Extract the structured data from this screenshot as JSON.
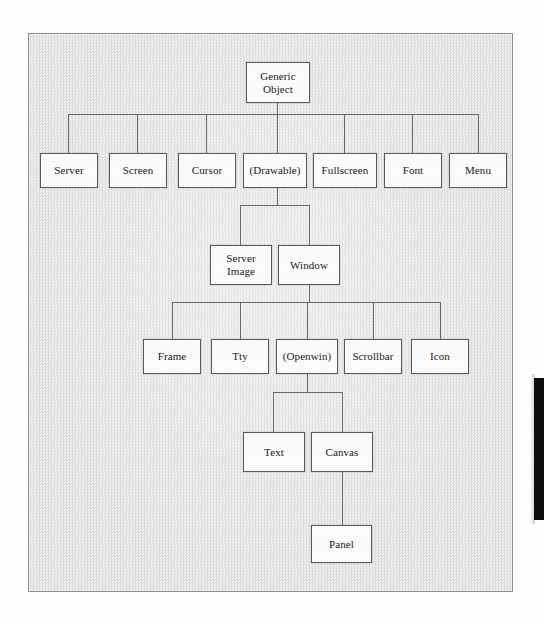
{
  "figure": {
    "kind": "class-hierarchy-diagram",
    "frame": {
      "x": 28,
      "y": 33,
      "width": 485,
      "height": 559,
      "border_color": "#8d8d8d",
      "fill_color": "#e8e8e8"
    },
    "node_style": {
      "border_color": "#5a5a5a",
      "fill_color": "#fbfbfb",
      "text_color": "#1a1a1a"
    },
    "edge_color": "#6a6a6a",
    "artifact": {
      "name": "page-edge-black-bar",
      "color": "#0b0b0b",
      "x": 534,
      "y": 378,
      "width": 10,
      "height": 142
    }
  },
  "nodes": [
    {
      "id": "generic-object",
      "label": "Generic\nObject",
      "line1": "Generic",
      "line2": "Object",
      "x": 246,
      "y": 62,
      "w": 64,
      "h": 41,
      "level": 0
    },
    {
      "id": "server",
      "label": "Server",
      "x": 40,
      "y": 153,
      "w": 58,
      "h": 35,
      "level": 1
    },
    {
      "id": "screen",
      "label": "Screen",
      "x": 109,
      "y": 153,
      "w": 58,
      "h": 35,
      "level": 1
    },
    {
      "id": "cursor",
      "label": "Cursor",
      "x": 178,
      "y": 153,
      "w": 58,
      "h": 35,
      "level": 1
    },
    {
      "id": "drawable",
      "label": "(Drawable)",
      "x": 243,
      "y": 153,
      "w": 64,
      "h": 35,
      "level": 1
    },
    {
      "id": "fullscreen",
      "label": "Fullscreen",
      "x": 313,
      "y": 153,
      "w": 64,
      "h": 35,
      "level": 1
    },
    {
      "id": "font",
      "label": "Font",
      "x": 384,
      "y": 153,
      "w": 58,
      "h": 35,
      "level": 1
    },
    {
      "id": "menu",
      "label": "Menu",
      "x": 449,
      "y": 153,
      "w": 58,
      "h": 35,
      "level": 1
    },
    {
      "id": "server-image",
      "label": "Server\nImage",
      "line1": "Server",
      "line2": "Image",
      "x": 210,
      "y": 245,
      "w": 62,
      "h": 40,
      "level": 2
    },
    {
      "id": "window",
      "label": "Window",
      "x": 278,
      "y": 245,
      "w": 62,
      "h": 40,
      "level": 2
    },
    {
      "id": "frame",
      "label": "Frame",
      "x": 143,
      "y": 339,
      "w": 58,
      "h": 35,
      "level": 3
    },
    {
      "id": "tty",
      "label": "Tty",
      "x": 211,
      "y": 339,
      "w": 58,
      "h": 35,
      "level": 3
    },
    {
      "id": "openwin",
      "label": "(Openwin)",
      "x": 276,
      "y": 339,
      "w": 62,
      "h": 35,
      "level": 3
    },
    {
      "id": "scrollbar",
      "label": "Scrollbar",
      "x": 344,
      "y": 339,
      "w": 58,
      "h": 35,
      "level": 3
    },
    {
      "id": "icon",
      "label": "Icon",
      "x": 411,
      "y": 339,
      "w": 58,
      "h": 35,
      "level": 3
    },
    {
      "id": "text",
      "label": "Text",
      "x": 243,
      "y": 432,
      "w": 62,
      "h": 40,
      "level": 4
    },
    {
      "id": "canvas",
      "label": "Canvas",
      "x": 311,
      "y": 432,
      "w": 62,
      "h": 40,
      "level": 4
    },
    {
      "id": "panel",
      "label": "Panel",
      "x": 311,
      "y": 525,
      "w": 61,
      "h": 38,
      "level": 5
    }
  ],
  "edges": [
    {
      "from": "generic-object",
      "to": "server"
    },
    {
      "from": "generic-object",
      "to": "screen"
    },
    {
      "from": "generic-object",
      "to": "cursor"
    },
    {
      "from": "generic-object",
      "to": "drawable"
    },
    {
      "from": "generic-object",
      "to": "fullscreen"
    },
    {
      "from": "generic-object",
      "to": "font"
    },
    {
      "from": "generic-object",
      "to": "menu"
    },
    {
      "from": "drawable",
      "to": "server-image"
    },
    {
      "from": "drawable",
      "to": "window"
    },
    {
      "from": "window",
      "to": "frame"
    },
    {
      "from": "window",
      "to": "tty"
    },
    {
      "from": "window",
      "to": "openwin"
    },
    {
      "from": "window",
      "to": "scrollbar"
    },
    {
      "from": "window",
      "to": "icon"
    },
    {
      "from": "openwin",
      "to": "text"
    },
    {
      "from": "openwin",
      "to": "canvas"
    },
    {
      "from": "canvas",
      "to": "panel"
    }
  ]
}
